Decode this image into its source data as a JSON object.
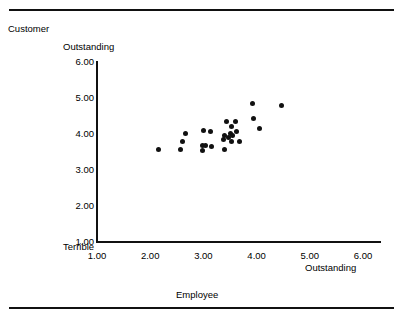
{
  "figure": {
    "customer_label": "Customer",
    "employee_label": "Employee"
  },
  "chart_data": {
    "type": "scatter",
    "title": "",
    "xlabel": "Employee",
    "ylabel": "Customer",
    "x_axis_low_label": "",
    "x_axis_high_label": "Outstanding",
    "y_axis_low_label": "Terrible",
    "y_axis_high_label": "Outstanding",
    "xlim": [
      1.0,
      6.0
    ],
    "ylim": [
      1.0,
      6.0
    ],
    "xticks": [
      "1.00",
      "2.00",
      "3.00",
      "4.00",
      "5.00",
      "6.00"
    ],
    "yticks": [
      "6.00",
      "5.00",
      "4.00",
      "3.00",
      "2.00",
      "1.00"
    ],
    "xtick_values": [
      1,
      2,
      3,
      4,
      5,
      6
    ],
    "ytick_values": [
      6,
      5,
      4,
      3,
      2,
      1
    ],
    "grid": false,
    "legend": null,
    "points": [
      {
        "x": 2.15,
        "y": 3.56
      },
      {
        "x": 2.57,
        "y": 3.56
      },
      {
        "x": 2.6,
        "y": 3.78
      },
      {
        "x": 2.66,
        "y": 4.02
      },
      {
        "x": 2.98,
        "y": 3.53
      },
      {
        "x": 2.98,
        "y": 3.67
      },
      {
        "x": 3.0,
        "y": 4.11
      },
      {
        "x": 3.04,
        "y": 3.69
      },
      {
        "x": 3.13,
        "y": 4.06
      },
      {
        "x": 3.15,
        "y": 3.64
      },
      {
        "x": 3.4,
        "y": 3.56
      },
      {
        "x": 3.38,
        "y": 3.84
      },
      {
        "x": 3.4,
        "y": 3.97
      },
      {
        "x": 3.43,
        "y": 4.35
      },
      {
        "x": 3.47,
        "y": 3.9
      },
      {
        "x": 3.5,
        "y": 4.02
      },
      {
        "x": 3.52,
        "y": 3.78
      },
      {
        "x": 3.53,
        "y": 4.22
      },
      {
        "x": 3.55,
        "y": 3.95
      },
      {
        "x": 3.6,
        "y": 4.35
      },
      {
        "x": 3.62,
        "y": 4.06
      },
      {
        "x": 3.67,
        "y": 3.8
      },
      {
        "x": 3.93,
        "y": 4.86
      },
      {
        "x": 3.95,
        "y": 4.44
      },
      {
        "x": 4.05,
        "y": 4.14
      },
      {
        "x": 4.47,
        "y": 4.78
      }
    ]
  }
}
